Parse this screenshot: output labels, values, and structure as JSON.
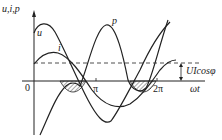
{
  "diagram": {
    "title": "",
    "y_axis_label": "u,i,p",
    "x_axis_label": "ωt",
    "origin_label": "0",
    "tick_labels": [
      "π",
      "2π"
    ],
    "curves": [
      {
        "name": "u",
        "label": "u",
        "description": "voltage sinusoid, larger amplitude"
      },
      {
        "name": "i",
        "label": "i",
        "description": "current sinusoid, lags voltage by φ"
      },
      {
        "name": "p",
        "label": "p",
        "description": "instantaneous power, double frequency, offset by UIcosφ"
      }
    ],
    "annotation": "UIcosφ",
    "hatched_regions": 2,
    "colors": {
      "line": "#222222",
      "background": "#ffffff"
    }
  }
}
